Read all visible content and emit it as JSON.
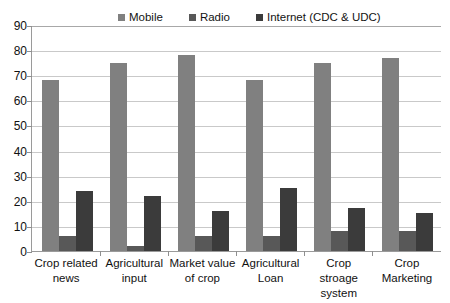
{
  "chart_data": {
    "type": "bar",
    "title": "",
    "xlabel": "",
    "ylabel": "",
    "ylim": [
      0,
      90
    ],
    "yticks": [
      0,
      10,
      20,
      30,
      40,
      50,
      60,
      70,
      80,
      90
    ],
    "grid": true,
    "legend_position": "top",
    "categories": [
      "Crop related news",
      "Agricultural input",
      "Market value of crop",
      "Agricultural Loan",
      "Crop stroage system",
      "Crop Marketing"
    ],
    "category_lines": [
      [
        "Crop related",
        "news"
      ],
      [
        "Agricultural",
        "input"
      ],
      [
        "Market value",
        "of crop"
      ],
      [
        "Agricultural",
        "Loan"
      ],
      [
        "Crop stroage",
        "system"
      ],
      [
        "Crop",
        "Marketing"
      ]
    ],
    "series": [
      {
        "name": "Mobile",
        "color": "#808080",
        "values": [
          68,
          75,
          78,
          68,
          75,
          77
        ]
      },
      {
        "name": "Radio",
        "color": "#585858",
        "values": [
          6,
          2,
          6,
          6,
          8,
          8
        ]
      },
      {
        "name": "Internet (CDC & UDC)",
        "color": "#3b3b3b",
        "values": [
          24,
          22,
          16,
          25,
          17,
          15
        ]
      }
    ]
  },
  "legend": {
    "items": [
      {
        "label": "Mobile",
        "color": "#808080"
      },
      {
        "label": "Radio",
        "color": "#585858"
      },
      {
        "label": "Internet (CDC & UDC)",
        "color": "#3b3b3b"
      }
    ]
  },
  "axis": {
    "y_tick_labels": [
      "90",
      "80",
      "70",
      "60",
      "50",
      "40",
      "30",
      "20",
      "10",
      "0"
    ]
  }
}
